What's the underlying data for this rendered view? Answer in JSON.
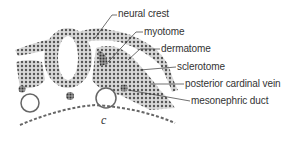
{
  "figure": {
    "panel_letter": "c",
    "labels": [
      {
        "id": "neural-crest",
        "text": "neural crest"
      },
      {
        "id": "myotome",
        "text": "myotome"
      },
      {
        "id": "dermatome",
        "text": "dermatome"
      },
      {
        "id": "sclerotome",
        "text": "sclerotome"
      },
      {
        "id": "posterior-cardinal-vein",
        "text": "posterior cardinal vein"
      },
      {
        "id": "mesonephric-duct",
        "text": "mesonephric duct"
      }
    ],
    "colors": {
      "ink": "#333333",
      "tissue": "#8a8a8a",
      "background": "#ffffff"
    }
  }
}
